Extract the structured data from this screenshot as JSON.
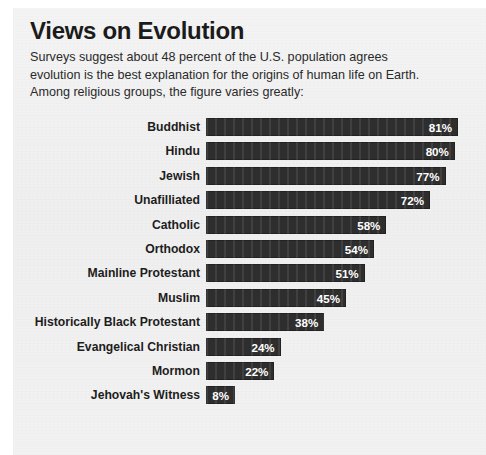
{
  "title": "Views on Evolution",
  "subtitle": {
    "line1": "Surveys suggest about 48 percent of the U.S. population agrees",
    "line2": "evolution is the best explanation for the origins of human life on Earth.",
    "line3": "Among religious groups, the figure varies greatly:"
  },
  "colors": {
    "bar": "#2e2e2e",
    "value_text": "#ffffff",
    "label_text": "#1d1d1d",
    "page_background": "#f1f1f1"
  },
  "chart_data": {
    "type": "bar",
    "orientation": "horizontal",
    "title": "Views on Evolution",
    "subtitle": "Surveys suggest about 48 percent of the U.S. population agrees evolution is the best explanation for the origins of human life on Earth. Among religious groups, the figure varies greatly:",
    "xlabel": "",
    "ylabel": "",
    "xlim": [
      0,
      81
    ],
    "grid": false,
    "legend": false,
    "value_suffix": "%",
    "national_average": 48,
    "categories": [
      "Buddhist",
      "Hindu",
      "Jewish",
      "Unafilliated",
      "Catholic",
      "Orthodox",
      "Mainline Protestant",
      "Muslim",
      "Historically Black Protestant",
      "Evangelical Christian",
      "Mormon",
      "Jehovah's Witness"
    ],
    "values": [
      81,
      80,
      77,
      72,
      58,
      54,
      51,
      45,
      38,
      24,
      22,
      8
    ],
    "value_labels": [
      "81%",
      "80%",
      "77%",
      "72%",
      "58%",
      "54%",
      "51%",
      "45%",
      "38%",
      "24%",
      "22%",
      "8%"
    ]
  }
}
